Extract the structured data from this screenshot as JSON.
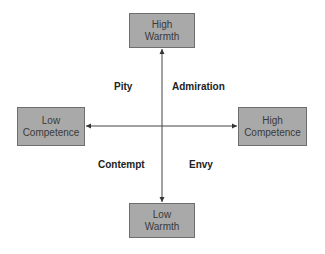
{
  "diagram": {
    "type": "two-axis quadrant diagram",
    "axes": {
      "vertical": {
        "top": {
          "line1": "High",
          "line2": "Warmth"
        },
        "bottom": {
          "line1": "Low",
          "line2": "Warmth"
        }
      },
      "horizontal": {
        "left": {
          "line1": "Low",
          "line2": "Competence"
        },
        "right": {
          "line1": "High",
          "line2": "Competence"
        }
      }
    },
    "quadrants": {
      "top_left": "Pity",
      "top_right": "Admiration",
      "bottom_left": "Contempt",
      "bottom_right": "Envy"
    },
    "colors": {
      "box_fill": "#a9a9a9",
      "box_border": "#6e6e6e",
      "axis_line": "#444444"
    }
  }
}
